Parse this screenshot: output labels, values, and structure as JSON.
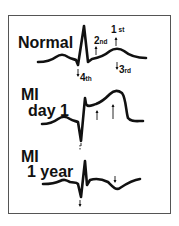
{
  "panels": [
    {
      "title_lines": [
        "Normal"
      ],
      "annotations": [
        {
          "num": "2",
          "suffix": "nd",
          "arrow": "up"
        },
        {
          "num": "1",
          "suffix": "st",
          "arrow": "up"
        },
        {
          "num": "3",
          "suffix": "rd",
          "arrow": "down"
        },
        {
          "num": "4",
          "suffix": "th",
          "arrow": "down"
        }
      ]
    },
    {
      "title_lines": [
        "MI",
        "day 1"
      ],
      "annotations": [
        {
          "arrow": "up"
        },
        {
          "arrow": "up"
        },
        {
          "arrow": "down"
        }
      ]
    },
    {
      "title_lines": [
        "MI",
        "1 year"
      ],
      "annotations": [
        {
          "arrow": "down"
        },
        {
          "arrow": "down"
        }
      ]
    }
  ],
  "colors": {
    "trace": "#111111",
    "frame": "#555555",
    "background": "#ffffff"
  }
}
